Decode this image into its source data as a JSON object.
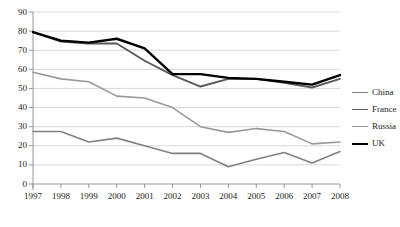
{
  "chart_data": {
    "type": "line",
    "title": "",
    "subtitle": "",
    "xlabel": "",
    "ylabel": "",
    "categories": [
      "1997",
      "1998",
      "1999",
      "2000",
      "2001",
      "2002",
      "2003",
      "2004",
      "2005",
      "2006",
      "2007",
      "2008"
    ],
    "x": [
      1997,
      1998,
      1999,
      2000,
      2001,
      2002,
      2003,
      2004,
      2005,
      2006,
      2007,
      2008
    ],
    "ylim": [
      0,
      90
    ],
    "xlim": [
      1997,
      2008
    ],
    "y_ticks": [
      0,
      10,
      20,
      30,
      40,
      50,
      60,
      70,
      80,
      90
    ],
    "grid": "horizontal",
    "legend_position": "right",
    "series": [
      {
        "name": "China",
        "color": "#808080",
        "width": 1.6,
        "values": [
          27.5,
          27.5,
          22.0,
          24.0,
          20.0,
          16.0,
          16.0,
          9.0,
          13.0,
          16.5,
          11.0,
          17.0
        ]
      },
      {
        "name": "France",
        "color": "#595959",
        "width": 1.9,
        "values": [
          79.5,
          74.5,
          73.5,
          73.5,
          64.5,
          57.0,
          51.0,
          55.0,
          55.0,
          53.0,
          50.5,
          55.0
        ]
      },
      {
        "name": "Russia",
        "color": "#999999",
        "width": 1.6,
        "values": [
          58.5,
          55.0,
          53.5,
          46.0,
          45.0,
          40.0,
          30.0,
          27.0,
          29.0,
          27.5,
          21.0,
          22.0
        ]
      },
      {
        "name": "UK",
        "color": "#000000",
        "width": 2.4,
        "values": [
          79.5,
          75.0,
          74.0,
          76.0,
          71.0,
          57.5,
          57.5,
          55.5,
          55.0,
          53.5,
          52.0,
          57.0
        ]
      }
    ]
  },
  "legend": {
    "entries": [
      {
        "label": "China"
      },
      {
        "label": "France"
      },
      {
        "label": "Russia"
      },
      {
        "label": "UK"
      }
    ]
  }
}
